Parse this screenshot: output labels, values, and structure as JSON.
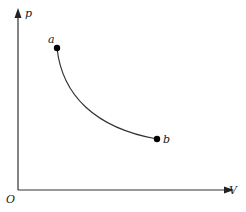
{
  "diagram": {
    "type": "pV-diagram",
    "axes": {
      "y_label": "p",
      "x_label": "V",
      "origin_label": "O"
    },
    "points": [
      {
        "label": "a",
        "x": 57,
        "y": 48
      },
      {
        "label": "b",
        "x": 157,
        "y": 139
      }
    ],
    "curve": {
      "from": "a",
      "to": "b",
      "shape": "hyperbola-like decreasing"
    },
    "colors": {
      "line": "#333333",
      "point": "#000000"
    }
  }
}
